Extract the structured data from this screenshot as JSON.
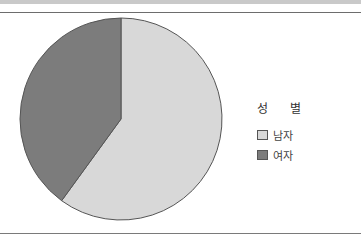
{
  "chart_data": {
    "type": "pie",
    "title": "성 별",
    "categories": [
      "남자",
      "여자"
    ],
    "values": [
      60,
      40
    ],
    "colors": [
      "#d8d8d8",
      "#7c7c7c"
    ],
    "start_angle": "12 o'clock",
    "direction": "clockwise",
    "legend_position": "right"
  },
  "legend": {
    "title": "성 별",
    "items": [
      {
        "label": "남자",
        "color": "#d8d8d8"
      },
      {
        "label": "여자",
        "color": "#7c7c7c"
      }
    ]
  }
}
